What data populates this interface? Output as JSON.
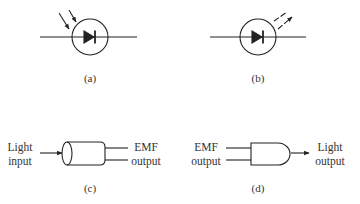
{
  "figure": {
    "panels": [
      {
        "id": "a",
        "caption": "(a)",
        "symbol": "photodiode",
        "arrow_direction": "incoming"
      },
      {
        "id": "b",
        "caption": "(b)",
        "symbol": "light-emitting-diode",
        "arrow_direction": "outgoing"
      },
      {
        "id": "c",
        "caption": "(c)",
        "symbol": "photo-detector-block",
        "input_label": [
          "Light",
          "input"
        ],
        "output_label": [
          "EMF",
          "output"
        ]
      },
      {
        "id": "d",
        "caption": "(d)",
        "symbol": "light-source-block",
        "input_label": [
          "EMF",
          "output"
        ],
        "output_label": [
          "Light",
          "output"
        ]
      }
    ]
  },
  "colors": {
    "stroke": "#222222",
    "background": "#ffffff"
  }
}
